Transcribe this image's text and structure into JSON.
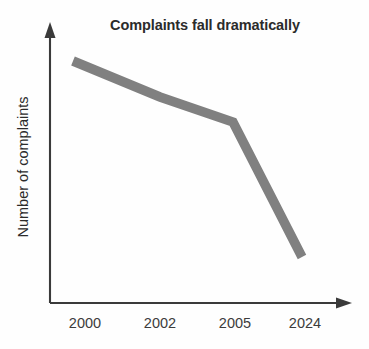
{
  "figure": {
    "name": "complaints-line-chart",
    "background_color": "#fefefe"
  },
  "chart_data": {
    "type": "line",
    "title": "Complaints fall dramatically",
    "subtitle": "",
    "xlabel": "",
    "ylabel": "Number of complaints",
    "categories": [
      "2000",
      "2002",
      "2005",
      "2024"
    ],
    "x": [
      "2000",
      "2002",
      "2005",
      "2024"
    ],
    "series": [
      {
        "name": "Number of complaints",
        "color": "#808080",
        "values": [
          100,
          85,
          74,
          19
        ]
      }
    ],
    "tick_labels": {
      "x": [
        "2000",
        "2002",
        "2005",
        "2024"
      ],
      "y": []
    },
    "ylim": [
      0,
      110
    ],
    "grid": false,
    "legend": false,
    "legend_position": "none",
    "annotations": [],
    "axis_style": {
      "arrowheads": true,
      "axis_color": "#3a3a3a",
      "line_color": "#808080",
      "line_width_px": 9.5
    },
    "pixel_points": [
      {
        "label": "2000",
        "x": 73,
        "y": 61
      },
      {
        "label": "2002",
        "x": 160,
        "y": 97
      },
      {
        "label": "2005",
        "x": 233,
        "y": 122
      },
      {
        "label": "2024",
        "x": 302,
        "y": 257
      }
    ]
  },
  "labels": {
    "title": "Complaints fall dramatically",
    "y_axis_title": "Number of complaints",
    "x_tick_2000": "2000",
    "x_tick_2002": "2002",
    "x_tick_2005": "2005",
    "x_tick_2024": "2024"
  }
}
